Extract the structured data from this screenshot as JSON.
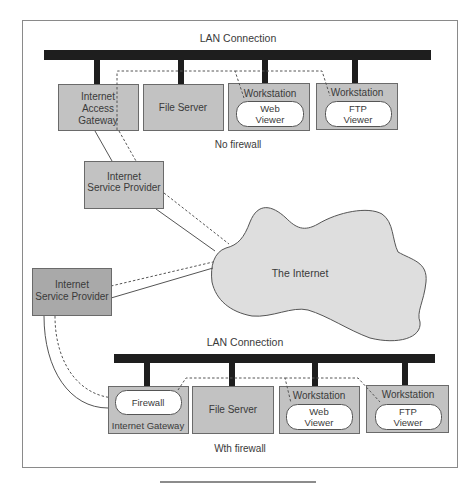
{
  "colors": {
    "box_fill": "#c2c2c2",
    "isp_dark_fill": "#a9a9a9",
    "cloud_fill": "#dedede",
    "bar": "#1e1e1e",
    "line": "#555555"
  },
  "top": {
    "lan_label": "LAN Connection",
    "caption": "No firewall",
    "gateway_lines": [
      "Internet",
      "Access",
      "Gateway"
    ],
    "file_server": "File Server",
    "ws_web": {
      "title": "Workstation",
      "app_lines": [
        "Web",
        "Viewer"
      ]
    },
    "ws_ftp": {
      "title": "Workstation",
      "app_lines": [
        "FTP",
        "Viewer"
      ]
    },
    "isp_lines": [
      "Internet",
      "Service Provider"
    ]
  },
  "internet": {
    "label": "The Internet"
  },
  "bottom": {
    "isp_lines": [
      "Internet",
      "Service Provider"
    ],
    "lan_label": "LAN Connection",
    "caption": "Wth firewall",
    "gateway": {
      "firewall": "Firewall",
      "label": "Internet Gateway"
    },
    "file_server": "File Server",
    "ws_web": {
      "title": "Workstation",
      "app_lines": [
        "Web",
        "Viewer"
      ]
    },
    "ws_ftp": {
      "title": "Workstation",
      "app_lines": [
        "FTP",
        "Viewer"
      ]
    }
  }
}
